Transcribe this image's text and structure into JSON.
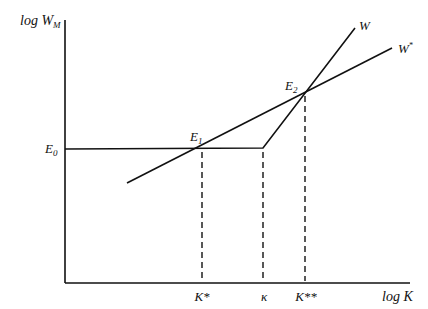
{
  "diagram": {
    "y_axis_label": {
      "main": "log W",
      "sub": "M"
    },
    "x_axis_label": "log K",
    "curves": [
      {
        "name": "W",
        "label": "W"
      },
      {
        "name": "W*",
        "label": "W",
        "sup": "*"
      }
    ],
    "points": [
      {
        "name": "E0",
        "label": "E",
        "sub": "0"
      },
      {
        "name": "E1",
        "label": "E",
        "sub": "1"
      },
      {
        "name": "E2",
        "label": "E",
        "sub": "2"
      }
    ],
    "x_ticks": [
      {
        "name": "K*",
        "label": "K*"
      },
      {
        "name": "kappa",
        "label": "κ"
      },
      {
        "name": "K**",
        "label": "K**"
      }
    ],
    "colors": {
      "line": "#111111",
      "background": "#ffffff"
    }
  }
}
